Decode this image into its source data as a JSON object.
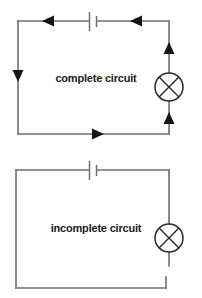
{
  "figure": {
    "background_color": "#ffffff",
    "wire_color": "#6e6e6e",
    "symbol_color": "#2b2b2b",
    "arrow_color": "#151515",
    "label_color": "#1a1a1a"
  },
  "circuits": [
    {
      "id": "complete-circuit",
      "label": "complete circuit",
      "state": "complete",
      "lamp": {
        "name": "lamp-symbol",
        "lit": true,
        "shaded": true
      },
      "battery": {
        "name": "battery-symbol",
        "plates": 2
      },
      "arrows": [
        {
          "name": "current-arrow-top-left",
          "direction": "left"
        },
        {
          "name": "current-arrow-top-right",
          "direction": "left"
        },
        {
          "name": "current-arrow-left",
          "direction": "down"
        },
        {
          "name": "current-arrow-bottom",
          "direction": "right"
        },
        {
          "name": "current-arrow-right-upper",
          "direction": "up"
        },
        {
          "name": "current-arrow-right-lower",
          "direction": "up"
        }
      ],
      "gap": false
    },
    {
      "id": "incomplete-circuit",
      "label": "incomplete circuit",
      "state": "incomplete",
      "lamp": {
        "name": "lamp-symbol",
        "lit": false,
        "shaded": false
      },
      "battery": {
        "name": "battery-symbol",
        "plates": 2
      },
      "arrows": [],
      "gap": true
    }
  ]
}
